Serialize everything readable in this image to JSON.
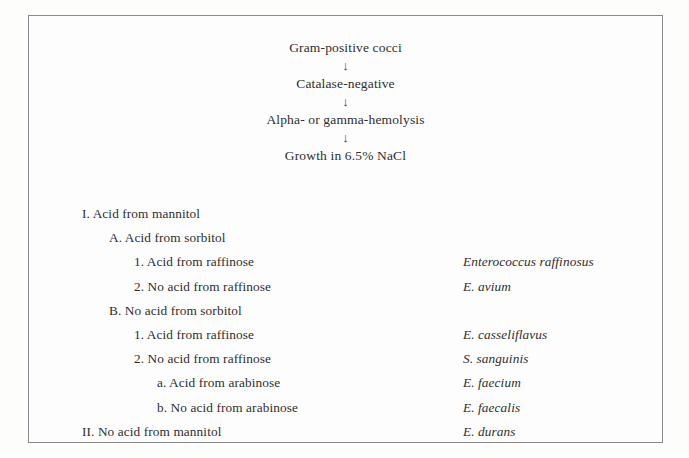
{
  "figure": {
    "text_color": "#2e2e30",
    "border_color": "#8b8b8f",
    "background_color": "#fdfdfd"
  },
  "chain": {
    "arrow_glyph": "↓",
    "steps": [
      "Gram-positive cocci",
      "Catalase-negative",
      "Alpha- or gamma-hemolysis",
      "Growth in 6.5% NaCl"
    ]
  },
  "key": {
    "rows": [
      {
        "level": 0,
        "label": "I. Acid from mannitol",
        "species": ""
      },
      {
        "level": 1,
        "label": "A. Acid from sorbitol",
        "species": ""
      },
      {
        "level": 2,
        "label": "1. Acid from raffinose",
        "species": "Enterococcus raffinosus"
      },
      {
        "level": 2,
        "label": "2. No acid from raffinose",
        "species": "E. avium"
      },
      {
        "level": 1,
        "label": "B. No acid from sorbitol",
        "species": ""
      },
      {
        "level": 2,
        "label": "1. Acid from raffinose",
        "species": "E. casseliflavus"
      },
      {
        "level": 2,
        "label": "2. No acid from raffinose",
        "species": "S. sanguinis"
      },
      {
        "level": 3,
        "label": "a. Acid from arabinose",
        "species": "E. faecium"
      },
      {
        "level": 3,
        "label": "b. No acid from arabinose",
        "species": "E. faecalis"
      },
      {
        "level": 0,
        "label": "II. No acid from mannitol",
        "species": "E. durans"
      }
    ]
  }
}
